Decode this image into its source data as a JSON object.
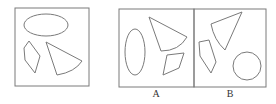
{
  "figure": {
    "question_panel": {
      "shapes": [
        "ellipse-horizontal",
        "hexagon-quadrilateral",
        "sector-triangle"
      ]
    },
    "options": [
      {
        "label": "A",
        "shapes": [
          "ellipse-vertical",
          "sector-triangle",
          "quadrilateral"
        ]
      },
      {
        "label": "B",
        "shapes": [
          "sector-triangle",
          "quadrilateral",
          "circle"
        ]
      }
    ],
    "stroke_color": "#777777"
  }
}
